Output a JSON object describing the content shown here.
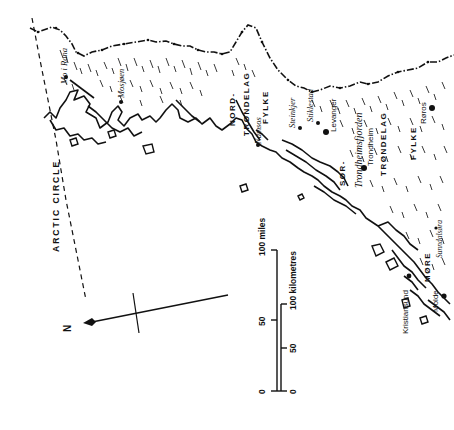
{
  "map": {
    "title": "",
    "orientation": "rotated 90 degrees; north points left",
    "colors": {
      "ink": "#111111",
      "paper": "#ffffff"
    },
    "regions": [
      {
        "id": "nord-trondelag",
        "lines": [
          "NORD-",
          "TRØNDELAG",
          "FYLKE"
        ]
      },
      {
        "id": "sor-trondelag",
        "lines": [
          "SØR-",
          "TRØNDELAG",
          "FYLKE"
        ]
      },
      {
        "id": "more",
        "lines": [
          "MØRE"
        ]
      }
    ],
    "places": [
      {
        "name": "Mo i Rana",
        "style": "italic"
      },
      {
        "name": "Mosjøen",
        "style": "italic"
      },
      {
        "name": "Namsos",
        "style": "italic"
      },
      {
        "name": "Steinkjer",
        "style": "italic"
      },
      {
        "name": "Stiklestad",
        "style": "italic"
      },
      {
        "name": "Levanger",
        "style": "regular"
      },
      {
        "name": "Trondheim",
        "style": "regular"
      },
      {
        "name": "Røros",
        "style": "regular"
      },
      {
        "name": "Sunndalsøra",
        "style": "italic"
      },
      {
        "name": "Kristiansund",
        "style": "regular"
      },
      {
        "name": "Molde",
        "style": "regular"
      }
    ],
    "water": [
      {
        "name": "Trondheimsfjorden",
        "style": "italic"
      }
    ],
    "lines": [
      {
        "name": "ARCTIC CIRCLE",
        "style": "dashed"
      }
    ],
    "north_arrow": {
      "label": "N"
    },
    "scale_bar": {
      "miles": {
        "ticks": [
          "0",
          "50",
          "100"
        ],
        "unit": "miles",
        "end_label": "100 miles"
      },
      "kilometres": {
        "ticks": [
          "0",
          "50",
          "100"
        ],
        "unit": "kilometres",
        "end_label": "100 kilometres"
      }
    }
  }
}
